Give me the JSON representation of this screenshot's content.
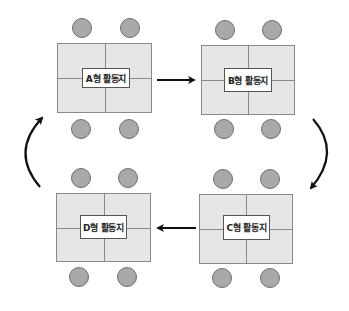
{
  "diagram": {
    "type": "rotation-stations",
    "colors": {
      "table_fill": "#e6e6e6",
      "table_border": "#8a8a8a",
      "seat_fill": "#a9a9a9",
      "arrow": "#111111"
    },
    "stations": [
      {
        "id": "A",
        "label": "A형 활동지",
        "seats": 4
      },
      {
        "id": "B",
        "label": "B형 활동지",
        "seats": 4
      },
      {
        "id": "C",
        "label": "C형 활동지",
        "seats": 4
      },
      {
        "id": "D",
        "label": "D형 활동지",
        "seats": 4
      }
    ],
    "flow": [
      {
        "from": "A",
        "to": "B",
        "style": "straight"
      },
      {
        "from": "B",
        "to": "C",
        "style": "curved"
      },
      {
        "from": "C",
        "to": "D",
        "style": "straight"
      },
      {
        "from": "D",
        "to": "A",
        "style": "curved"
      }
    ]
  }
}
